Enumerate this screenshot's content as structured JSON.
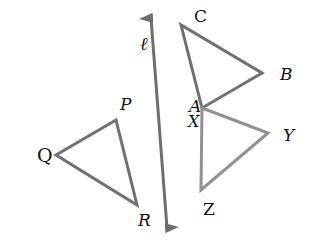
{
  "diagram": {
    "line": {
      "label": "ℓ",
      "from": [
        150,
        14
      ],
      "to": [
        168,
        232
      ],
      "color": "#6e6e6e"
    },
    "triangles": [
      {
        "name": "ABC",
        "vertices": {
          "A": [
            202,
            108
          ],
          "B": [
            262,
            73
          ],
          "C": [
            181,
            25
          ]
        },
        "labels": {
          "A": "A",
          "B": "B",
          "C": "C"
        }
      },
      {
        "name": "XYZ",
        "vertices": {
          "X": [
            202,
            108
          ],
          "Y": [
            268,
            133
          ],
          "Z": [
            201,
            190
          ]
        },
        "labels": {
          "X": "X",
          "Y": "Y",
          "Z": "Z"
        }
      },
      {
        "name": "PQR",
        "vertices": {
          "P": [
            116,
            120
          ],
          "Q": [
            56,
            155
          ],
          "R": [
            137,
            205
          ]
        },
        "labels": {
          "P": "P",
          "Q": "Q",
          "R": "R"
        }
      }
    ],
    "stroke_color": "#707070"
  }
}
